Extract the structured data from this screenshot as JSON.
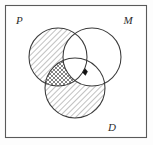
{
  "figure": {
    "kind": "venn-diagram",
    "background_color": "#ffffff",
    "frame": {
      "stroke_color": "#5a5a5a",
      "x": 5.5,
      "y": 5.5,
      "width": 141,
      "height": 132
    },
    "labels": {
      "p": "P",
      "m": "M",
      "d": "D"
    },
    "label_positions": {
      "p": {
        "x": 16,
        "y": 24
      },
      "m": {
        "x": 128,
        "y": 24
      },
      "d": {
        "x": 112,
        "y": 131
      }
    },
    "circles": [
      {
        "name": "P",
        "cx": 58,
        "cy": 57,
        "r": 29,
        "stroke_color": "#3a3a3a"
      },
      {
        "name": "M",
        "cx": 92,
        "cy": 57,
        "r": 29,
        "stroke_color": "#3a3a3a"
      },
      {
        "name": "D",
        "cx": 75,
        "cy": 88,
        "r": 30,
        "stroke_color": "#3a3a3a"
      }
    ],
    "regions": [
      {
        "name": "P-only",
        "expression": "P \\ (M ∪ D)",
        "shading": "single-hatch-forward",
        "shaded": true
      },
      {
        "name": "M-only",
        "expression": "M \\ (P ∪ D)",
        "shading": "none",
        "shaded": false
      },
      {
        "name": "D-only",
        "expression": "D \\ (P ∪ M)",
        "shading": "single-hatch-forward",
        "shaded": true
      },
      {
        "name": "P-and-M-only",
        "expression": "(P ∩ M) \\ D",
        "shading": "none",
        "shaded": false
      },
      {
        "name": "P-and-D-only",
        "expression": "(P ∩ D) \\ M",
        "shading": "cross-hatch",
        "shaded": true
      },
      {
        "name": "M-and-D-only",
        "expression": "(M ∩ D) \\ P",
        "shading": "none",
        "shaded": false
      },
      {
        "name": "P-and-M-and-D",
        "expression": "P ∩ M ∩ D",
        "shading": "none",
        "shaded": false
      }
    ],
    "marker": {
      "name": "point-marker",
      "shape": "filled-dot",
      "color": "#111111",
      "x": 85,
      "y": 72,
      "located_in": "P ∩ M ∩ D"
    },
    "hatch": {
      "line_color": "#2f2f2f",
      "line_width": 0.55,
      "spacing": 4,
      "forward_angle_deg": 45,
      "backward_angle_deg": -45
    }
  }
}
